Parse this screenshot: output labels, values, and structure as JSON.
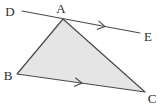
{
  "diagram": {
    "background": "#ffffff",
    "stroke_color": "#4a4a4a",
    "label_color": "#2e2e2e",
    "canvas": {
      "width": 161,
      "height": 104
    },
    "triangle": {
      "name": "ABC",
      "fill": "#e5e5e5",
      "stroke_width": 1.2,
      "vertices": {
        "A": [
          63,
          19
        ],
        "B": [
          17,
          74
        ],
        "C": [
          145,
          92
        ]
      }
    },
    "line_de": {
      "name": "DE",
      "from": [
        22,
        11
      ],
      "to": [
        140,
        33
      ],
      "stroke_width": 1.1,
      "passes_through": "A"
    },
    "parallel_marks": [
      {
        "on": "line-DE",
        "x": 105,
        "y": 26.5,
        "angle_deg": 10.6,
        "size": 7
      },
      {
        "on": "side-BC",
        "x": 82,
        "y": 83.1,
        "angle_deg": 8.0,
        "size": 7
      }
    ],
    "labels": [
      {
        "text": "D",
        "x": 10,
        "y": 16
      },
      {
        "text": "A",
        "x": 61,
        "y": 13
      },
      {
        "text": "E",
        "x": 148,
        "y": 41
      },
      {
        "text": "B",
        "x": 8,
        "y": 80
      },
      {
        "text": "C",
        "x": 152,
        "y": 103
      }
    ]
  }
}
